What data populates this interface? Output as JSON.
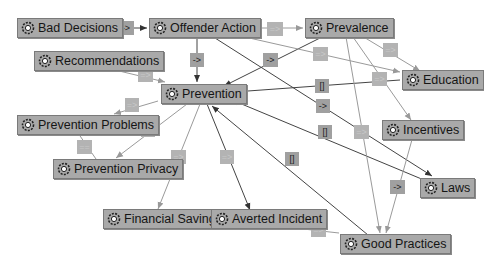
{
  "nodes": {
    "bad_decisions": "Bad Decisions",
    "offender_action": "Offender Action",
    "prevalence": "Prevalence",
    "recommendations": "Recommendations",
    "prevention": "Prevention",
    "education": "Education",
    "prevention_problems": "Prevention Problems",
    "prevention_privacy": "Prevention Privacy",
    "incentives": "Incentives",
    "laws": "Laws",
    "financial_savings": "Financial Savings",
    "averted_incident": "Averted Incident",
    "good_practices": "Good Practices"
  },
  "edge_labels": {
    "bad_to_offender": "->",
    "offender_to_prevalence": "=>",
    "offender_to_prevention": "->",
    "prevalence_to_prevention": "->",
    "offender_to_education": "=>",
    "prevalence_to_education": "=>",
    "recommendations_to_prevention": "=>",
    "education_to_prevention": "[]",
    "prevalence_to_incentives": "=>",
    "prevention_to_problems": "=>",
    "prevention_to_privacy": "=>",
    "problems_privacy": "==",
    "offender_to_laws": "->",
    "laws_to_prevention": "[]",
    "prevalence_to_good": "=>",
    "good_to_prevention": "[]",
    "incentives_to_good": "->",
    "prevention_to_financial": "=>",
    "prevention_to_averted": "=>",
    "averted_to_good": "=>"
  },
  "icon": "gear-flower-icon"
}
